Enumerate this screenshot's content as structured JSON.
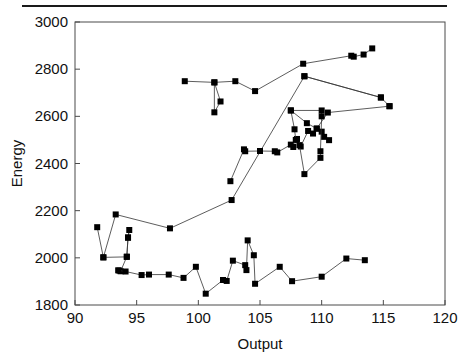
{
  "figure": {
    "top_rule": true,
    "background_color": "#ffffff",
    "foreground_color": "#111111"
  },
  "chart_data": {
    "type": "line",
    "title": "",
    "subtitle": "",
    "xlabel": "Output",
    "ylabel": "Energy",
    "xlim": [
      90,
      120
    ],
    "ylim": [
      1800,
      3000
    ],
    "xticks": [
      90,
      95,
      100,
      105,
      110,
      115,
      120
    ],
    "yticks": [
      1800,
      2000,
      2200,
      2400,
      2600,
      2800,
      3000
    ],
    "xtick_labels": [
      "90",
      "95",
      "100",
      "105",
      "110",
      "115",
      "120"
    ],
    "ytick_labels": [
      "1800",
      "2000",
      "2200",
      "2400",
      "2600",
      "2800",
      "3000"
    ],
    "grid": false,
    "legend": null,
    "legend_position": "none",
    "marker": "square",
    "marker_color": "#000000",
    "marker_size": 6,
    "line_color": "#333333",
    "line_width": 0.8,
    "series": [
      {
        "name": "trajectory-low",
        "connected": true,
        "points": [
          [
            91.8,
            2130
          ],
          [
            92.3,
            2002
          ],
          [
            93.3,
            2184
          ],
          [
            97.7,
            2125
          ],
          [
            102.7,
            2245
          ],
          [
            108.6,
            2770
          ],
          [
            114.8,
            2680
          ],
          [
            115.5,
            2643
          ]
        ]
      },
      {
        "name": "trajectory-left-loop",
        "connected": true,
        "points": [
          [
            93.6,
            1946
          ],
          [
            93.7,
            1943
          ],
          [
            94.2,
            2005
          ],
          [
            94.3,
            2087
          ],
          [
            94.4,
            2118
          ],
          [
            94.3,
            2085
          ],
          [
            94.2,
            2004
          ],
          [
            92.3,
            2002
          ]
        ]
      },
      {
        "name": "trajectory-bottom",
        "connected": true,
        "points": [
          [
            93.5,
            1947
          ],
          [
            94.1,
            1942
          ],
          [
            95.4,
            1927
          ],
          [
            96.0,
            1929
          ],
          [
            97.6,
            1929
          ],
          [
            98.8,
            1915
          ],
          [
            99.8,
            1962
          ],
          [
            100.6,
            1848
          ],
          [
            102.0,
            1906
          ],
          [
            102.3,
            1902
          ],
          [
            102.8,
            1988
          ],
          [
            103.8,
            1969
          ],
          [
            103.9,
            1948
          ],
          [
            104.0,
            2074
          ],
          [
            104.5,
            2011
          ],
          [
            104.6,
            1890
          ],
          [
            106.6,
            1962
          ],
          [
            107.6,
            1901
          ],
          [
            110.0,
            1920
          ],
          [
            112.0,
            1997
          ],
          [
            113.5,
            1990
          ]
        ]
      },
      {
        "name": "trajectory-upper",
        "connected": true,
        "points": [
          [
            98.9,
            2749
          ],
          [
            101.3,
            2744
          ],
          [
            101.3,
            2617
          ],
          [
            101.8,
            2663
          ],
          [
            101.3,
            2744
          ],
          [
            103.0,
            2749
          ],
          [
            104.6,
            2707
          ],
          [
            108.5,
            2823
          ],
          [
            112.4,
            2857
          ],
          [
            112.6,
            2853
          ],
          [
            113.4,
            2862
          ],
          [
            114.1,
            2888
          ]
        ]
      },
      {
        "name": "trajectory-mid-rise",
        "connected": true,
        "points": [
          [
            102.6,
            2325
          ],
          [
            103.7,
            2460
          ],
          [
            103.8,
            2452
          ],
          [
            105.0,
            2453
          ],
          [
            106.2,
            2452
          ],
          [
            106.4,
            2447
          ],
          [
            107.5,
            2480
          ],
          [
            107.7,
            2470
          ],
          [
            108.0,
            2504
          ],
          [
            108.3,
            2472
          ],
          [
            108.9,
            2538
          ],
          [
            109.3,
            2527
          ],
          [
            109.6,
            2548
          ],
          [
            110.0,
            2535
          ],
          [
            110.2,
            2513
          ],
          [
            110.6,
            2499
          ]
        ]
      },
      {
        "name": "trajectory-dense-cluster",
        "connected": true,
        "points": [
          [
            107.5,
            2625
          ],
          [
            107.8,
            2545
          ],
          [
            107.9,
            2500
          ],
          [
            108.2,
            2478
          ],
          [
            108.6,
            2355
          ],
          [
            109.9,
            2424
          ],
          [
            109.9,
            2452
          ],
          [
            110.0,
            2600
          ],
          [
            110.0,
            2625
          ],
          [
            107.5,
            2625
          ],
          [
            108.8,
            2571
          ],
          [
            109.6,
            2548
          ],
          [
            110.5,
            2616
          ],
          [
            115.5,
            2643
          ]
        ]
      },
      {
        "name": "trajectory-crossing",
        "connected": true,
        "points": [
          [
            108.6,
            2770
          ],
          [
            114.8,
            2680
          ]
        ]
      }
    ]
  }
}
